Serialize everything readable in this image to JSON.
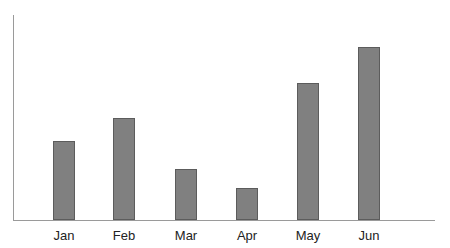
{
  "chart_data": {
    "type": "bar",
    "title": "",
    "subtitle": "",
    "xlabel": "",
    "ylabel": "",
    "categories": [
      "Jan",
      "Feb",
      "Mar",
      "Apr",
      "May",
      "Jun"
    ],
    "values": [
      46,
      59,
      29,
      18,
      79,
      100
    ],
    "bar_pixel_heights": [
      79,
      102,
      51,
      32,
      137,
      173
    ],
    "ylim": [
      0,
      118
    ],
    "grid": false,
    "legend": null,
    "legend_position": "none",
    "annotations": [],
    "axis": {
      "x_axis_visible": true,
      "y_axis_visible": true,
      "y_tick_labels": [],
      "x_tick_labels": [
        "Jan",
        "Feb",
        "Mar",
        "Apr",
        "May",
        "Jun"
      ]
    },
    "style": {
      "bar_fill": "#808080",
      "bar_border": "#5c5c5c",
      "axis_color": "#9a9a9a",
      "label_color": "#232323",
      "background": "#ffffff",
      "bar_width_px": 22
    },
    "geometry": {
      "baseline_y": 220,
      "axis_y_x": 13,
      "axis_y_top": 15,
      "axis_x_right": 435,
      "bar_left_positions": [
        53,
        113,
        175,
        236,
        297,
        358
      ],
      "bar_top_positions": [
        141,
        118,
        169,
        188,
        83,
        47
      ],
      "label_center_positions": [
        64,
        124,
        186,
        247,
        308,
        369
      ]
    }
  }
}
